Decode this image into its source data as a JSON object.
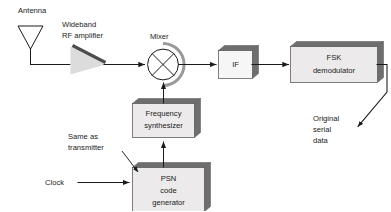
{
  "diagram": {
    "background_color": "#ffffff",
    "text_color": "#1a1a1a",
    "box_face_color": "#eceaea",
    "box_shadow_color": "#7c7c7c",
    "amplifier_fill_color": "#dcdcdc"
  },
  "labels": {
    "antenna": "Antenna",
    "wideband": "Wideband",
    "rf_amplifier": "RF amplifier",
    "mixer": "Mixer",
    "same_as": "Same as",
    "transmitter": "transmitter",
    "clock": "Clock",
    "original": "Original",
    "serial": "serial",
    "data": "data"
  },
  "blocks": {
    "if": {
      "line1": "IF"
    },
    "fsk": {
      "line1": "FSK",
      "line2": "demodulator"
    },
    "synth": {
      "line1": "Frequency",
      "line2": "synthesizer"
    },
    "psn": {
      "line1": "PSN",
      "line2": "code",
      "line3": "generator"
    }
  },
  "icons": {
    "antenna": "antenna-icon",
    "amplifier": "amplifier-triangle-icon",
    "mixer": "mixer-multiplier-icon"
  }
}
